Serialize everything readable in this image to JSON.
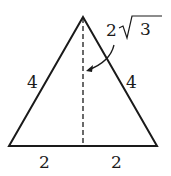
{
  "diagram": {
    "type": "equilateral triangle with altitude",
    "labels": {
      "left_side": "4",
      "right_side": "4",
      "base_left": "2",
      "base_right": "2",
      "altitude_coef": "2",
      "altitude_radicand": "3"
    },
    "colors": {
      "stroke": "#1a1a1a",
      "background": "#ffffff"
    }
  }
}
